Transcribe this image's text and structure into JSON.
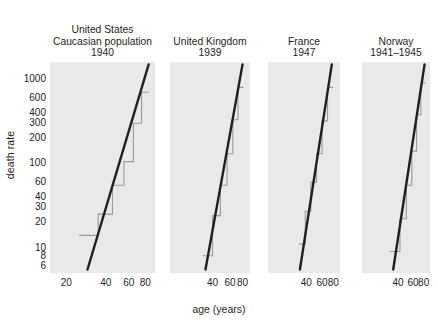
{
  "chart_data": {
    "type": "line",
    "title": "",
    "xlabel": "age (years)",
    "ylabel": "death rate",
    "xscale": "log",
    "yscale": "log",
    "xlim": [
      15,
      95
    ],
    "ylim": [
      5,
      1600
    ],
    "grid": false,
    "legend": "none",
    "yticks": [
      {
        "value": 1000,
        "label": "1000"
      },
      {
        "value": 600,
        "label": "600"
      },
      {
        "value": 400,
        "label": "400"
      },
      {
        "value": 300,
        "label": "300"
      },
      {
        "value": 200,
        "label": "200"
      },
      {
        "value": 100,
        "label": "100"
      },
      {
        "value": 60,
        "label": "60"
      },
      {
        "value": 40,
        "label": "40"
      },
      {
        "value": 30,
        "label": "30"
      },
      {
        "value": 20,
        "label": "20"
      },
      {
        "value": 10,
        "label": "10"
      },
      {
        "value": 8,
        "label": "8"
      },
      {
        "value": 6,
        "label": "6"
      }
    ],
    "panels": [
      {
        "id": "united-states",
        "title_lines": [
          "United States",
          "Caucasian population",
          "1940"
        ],
        "xticks": [
          {
            "value": 20,
            "label": "20"
          },
          {
            "value": 40,
            "label": "40"
          },
          {
            "value": 60,
            "label": "60"
          },
          {
            "value": 80,
            "label": "80"
          }
        ],
        "series": [
          {
            "name": "observed death rate (age bands)",
            "type": "step",
            "color": "#9a9a9a",
            "points": [
              {
                "age_low": 25,
                "age_high": 35,
                "rate": 14
              },
              {
                "age_low": 35,
                "age_high": 45,
                "rate": 25
              },
              {
                "age_low": 45,
                "age_high": 55,
                "rate": 55
              },
              {
                "age_low": 55,
                "age_high": 65,
                "rate": 105
              },
              {
                "age_low": 65,
                "age_high": 75,
                "rate": 300
              },
              {
                "age_low": 75,
                "age_high": 85,
                "rate": 700
              }
            ]
          },
          {
            "name": "Gompertz fit",
            "type": "line",
            "color": "#231f20",
            "endpoints": [
              {
                "age": 29,
                "rate": 5.5
              },
              {
                "age": 85,
                "rate": 1500
              }
            ]
          }
        ]
      },
      {
        "id": "united-kingdom",
        "title_lines": [
          "United Kingdom",
          "1939"
        ],
        "xticks": [
          {
            "value": 40,
            "label": "40"
          },
          {
            "value": 60,
            "label": "60"
          },
          {
            "value": 80,
            "label": "80"
          }
        ],
        "series": [
          {
            "name": "observed death rate (age bands)",
            "type": "step",
            "color": "#9a9a9a",
            "points": [
              {
                "age_low": 32,
                "age_high": 40,
                "rate": 8
              },
              {
                "age_low": 40,
                "age_high": 48,
                "rate": 24
              },
              {
                "age_low": 48,
                "age_high": 56,
                "rate": 55
              },
              {
                "age_low": 56,
                "age_high": 64,
                "rate": 130
              },
              {
                "age_low": 64,
                "age_high": 72,
                "rate": 330
              },
              {
                "age_low": 72,
                "age_high": 82,
                "rate": 800
              }
            ]
          },
          {
            "name": "Gompertz fit",
            "type": "line",
            "color": "#231f20",
            "endpoints": [
              {
                "age": 34,
                "rate": 5.5
              },
              {
                "age": 80,
                "rate": 1500
              }
            ]
          }
        ]
      },
      {
        "id": "france",
        "title_lines": [
          "France",
          "1947"
        ],
        "xticks": [
          {
            "value": 40,
            "label": "40"
          },
          {
            "value": 60,
            "label": "60"
          },
          {
            "value": 80,
            "label": "80"
          }
        ],
        "series": [
          {
            "name": "observed death rate (age bands)",
            "type": "step",
            "color": "#9a9a9a",
            "points": [
              {
                "age_low": 33,
                "age_high": 39,
                "rate": 11
              },
              {
                "age_low": 39,
                "age_high": 45,
                "rate": 27
              },
              {
                "age_low": 45,
                "age_high": 52,
                "rate": 60
              },
              {
                "age_low": 52,
                "age_high": 60,
                "rate": 130
              },
              {
                "age_low": 60,
                "age_high": 69,
                "rate": 320
              },
              {
                "age_low": 69,
                "age_high": 80,
                "rate": 800
              }
            ]
          },
          {
            "name": "Gompertz fit",
            "type": "line",
            "color": "#231f20",
            "endpoints": [
              {
                "age": 34,
                "rate": 5.5
              },
              {
                "age": 77,
                "rate": 1500
              }
            ]
          }
        ]
      },
      {
        "id": "norway",
        "title_lines": [
          "Norway",
          "1941–1945"
        ],
        "xticks": [
          {
            "value": 40,
            "label": "40"
          },
          {
            "value": 60,
            "label": "60"
          },
          {
            "value": 80,
            "label": "80"
          }
        ],
        "series": [
          {
            "name": "observed death rate (age bands)",
            "type": "step",
            "color": "#9a9a9a",
            "points": [
              {
                "age_low": 32,
                "age_high": 42,
                "rate": 9
              },
              {
                "age_low": 42,
                "age_high": 50,
                "rate": 22
              },
              {
                "age_low": 50,
                "age_high": 58,
                "rate": 55
              },
              {
                "age_low": 58,
                "age_high": 66,
                "rate": 140
              },
              {
                "age_low": 66,
                "age_high": 74,
                "rate": 380
              },
              {
                "age_low": 74,
                "age_high": 84,
                "rate": 900
              }
            ]
          },
          {
            "name": "Gompertz fit",
            "type": "line",
            "color": "#231f20",
            "endpoints": [
              {
                "age": 35,
                "rate": 5.5
              },
              {
                "age": 82,
                "rate": 1500
              }
            ]
          }
        ]
      }
    ]
  },
  "style": {
    "panel_bg": "#e9e9e9",
    "step_color": "#9a9a9a",
    "fit_color": "#231f20",
    "page_bg": "#ffffff",
    "text_color": "#231f20"
  }
}
